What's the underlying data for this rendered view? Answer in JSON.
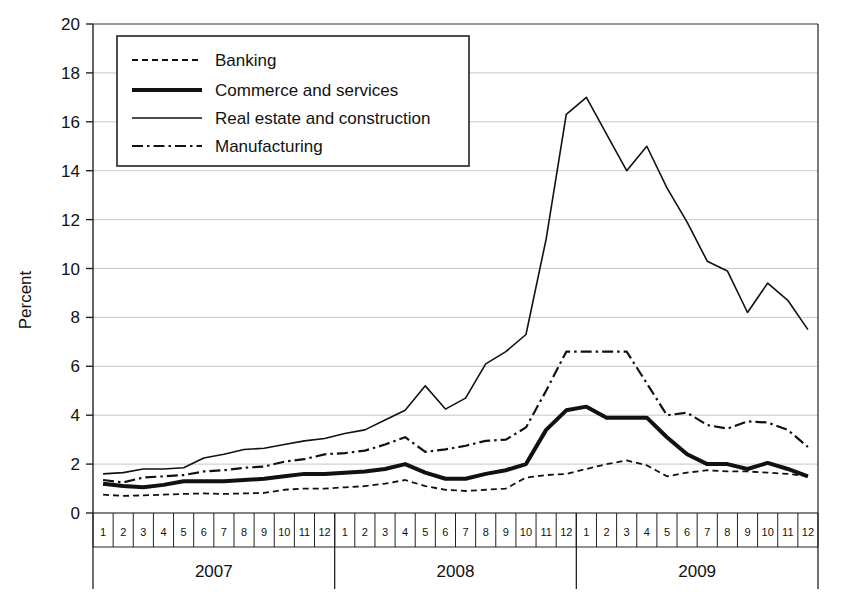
{
  "chart_data": {
    "type": "line",
    "title": "",
    "xlabel": "",
    "ylabel": "Percent",
    "ylim": [
      0,
      20
    ],
    "ytick_step": 2,
    "yticks": [
      "0",
      "2",
      "4",
      "6",
      "8",
      "10",
      "12",
      "14",
      "16",
      "18",
      "20"
    ],
    "grid": true,
    "legend_position": "top-left-inside",
    "months": [
      "1",
      "2",
      "3",
      "4",
      "5",
      "6",
      "7",
      "8",
      "9",
      "10",
      "11",
      "12"
    ],
    "years": [
      "2007",
      "2008",
      "2009"
    ],
    "x_categories": [
      "2007-1",
      "2007-2",
      "2007-3",
      "2007-4",
      "2007-5",
      "2007-6",
      "2007-7",
      "2007-8",
      "2007-9",
      "2007-10",
      "2007-11",
      "2007-12",
      "2008-1",
      "2008-2",
      "2008-3",
      "2008-4",
      "2008-5",
      "2008-6",
      "2008-7",
      "2008-8",
      "2008-9",
      "2008-10",
      "2008-11",
      "2008-12",
      "2009-1",
      "2009-2",
      "2009-3",
      "2009-4",
      "2009-5",
      "2009-6",
      "2009-7",
      "2009-8",
      "2009-9",
      "2009-10",
      "2009-11",
      "2009-12"
    ],
    "series": [
      {
        "name": "Banking",
        "style": "dotted",
        "color": "#111111",
        "width": 1.8,
        "values": [
          0.75,
          0.7,
          0.72,
          0.75,
          0.78,
          0.8,
          0.78,
          0.8,
          0.82,
          0.95,
          1.0,
          1.0,
          1.05,
          1.1,
          1.2,
          1.35,
          1.1,
          0.95,
          0.9,
          0.95,
          1.0,
          1.45,
          1.55,
          1.6,
          1.8,
          2.0,
          2.15,
          1.95,
          1.5,
          1.65,
          1.75,
          1.7,
          1.7,
          1.65,
          1.6,
          1.5
        ]
      },
      {
        "name": "Commerce and services",
        "style": "solid-thick",
        "color": "#111111",
        "width": 4.0,
        "values": [
          1.2,
          1.1,
          1.05,
          1.15,
          1.3,
          1.3,
          1.3,
          1.35,
          1.4,
          1.5,
          1.6,
          1.6,
          1.65,
          1.7,
          1.8,
          2.0,
          1.65,
          1.4,
          1.4,
          1.6,
          1.75,
          2.0,
          3.4,
          4.2,
          4.35,
          3.9,
          3.9,
          3.9,
          3.1,
          2.4,
          2.0,
          2.0,
          1.8,
          2.05,
          1.8,
          1.5
        ]
      },
      {
        "name": "Real estate and construction",
        "style": "solid-thin",
        "color": "#111111",
        "width": 1.6,
        "values": [
          1.6,
          1.65,
          1.8,
          1.8,
          1.85,
          2.25,
          2.4,
          2.6,
          2.65,
          2.8,
          2.95,
          3.05,
          3.25,
          3.4,
          3.8,
          4.2,
          5.2,
          4.25,
          4.7,
          6.1,
          6.6,
          7.3,
          11.2,
          16.3,
          17.0,
          15.5,
          14.0,
          15.0,
          13.3,
          11.9,
          10.3,
          9.9,
          8.2,
          9.4,
          8.7,
          7.5
        ]
      },
      {
        "name": "Manufacturing",
        "style": "dash-dot",
        "color": "#111111",
        "width": 2.2,
        "values": [
          1.35,
          1.25,
          1.45,
          1.5,
          1.55,
          1.7,
          1.75,
          1.85,
          1.9,
          2.1,
          2.2,
          2.4,
          2.45,
          2.55,
          2.8,
          3.1,
          2.5,
          2.6,
          2.75,
          2.95,
          3.0,
          3.5,
          5.0,
          6.6,
          6.6,
          6.6,
          6.6,
          5.3,
          4.0,
          4.1,
          3.6,
          3.45,
          3.75,
          3.7,
          3.4,
          2.7
        ]
      }
    ]
  },
  "legend": {
    "items": [
      {
        "label": "Banking"
      },
      {
        "label": "Commerce and services"
      },
      {
        "label": "Real estate and construction"
      },
      {
        "label": "Manufacturing"
      }
    ]
  },
  "axes": {
    "y_title": "Percent"
  }
}
